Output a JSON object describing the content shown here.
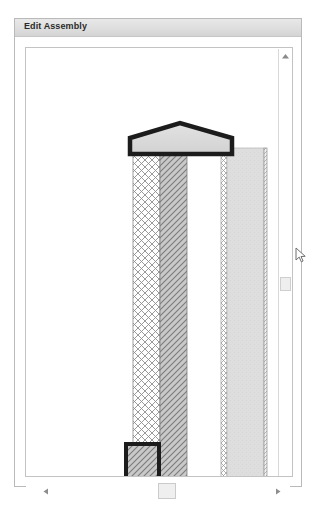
{
  "window": {
    "title": "Edit Assembly"
  },
  "canvas": {
    "name": "assembly-section-preview",
    "background": "#ffffff",
    "border_color": "#c3c3c3"
  },
  "scrollbars": {
    "vertical": {
      "up_arrow_icon": "triangle-up-icon",
      "thumb_icon": "vertical-scroll-thumb",
      "thumb_position_pct": 53
    },
    "horizontal": {
      "left_arrow_icon": "triangle-left-icon",
      "right_arrow_icon": "triangle-right-icon",
      "thumb_icon": "horizontal-scroll-thumb",
      "thumb_position_pct": 50
    }
  },
  "cursor": {
    "icon": "mouse-pointer-icon"
  },
  "assembly": {
    "cap": {
      "name": "top-cap-element",
      "shape": "pentagon-peaked",
      "fill": "#dcdcdc",
      "stroke": "#1c1c1c",
      "stroke_width": 4,
      "x": 113,
      "y": 103,
      "width": 106,
      "height": 31
    },
    "layers": [
      {
        "name": "layer-crosshatch-outer",
        "pattern": "crosshatch",
        "fill": "#ffffff",
        "stroke": "#8c8c8c",
        "x": 117,
        "y": 133,
        "width": 27,
        "height": 330
      },
      {
        "name": "layer-diagonal-hatch-core",
        "pattern": "diagonal-hatch",
        "fill": "#c9c9c9",
        "stroke": "#7d7d7d",
        "x": 144,
        "y": 133,
        "width": 27,
        "height": 330
      },
      {
        "name": "layer-air-gap",
        "pattern": "none",
        "fill": "#ffffff",
        "stroke": "#ffffff",
        "x": 171,
        "y": 133,
        "width": 34,
        "height": 330
      },
      {
        "name": "layer-crosshatch-inner",
        "pattern": "crosshatch",
        "fill": "#ffffff",
        "stroke": "#9a9a9a",
        "x": 205,
        "y": 128,
        "width": 6,
        "height": 335
      },
      {
        "name": "layer-solid-board",
        "pattern": "solid",
        "fill": "#dedede",
        "stroke": "#b4b4b4",
        "x": 211,
        "y": 128,
        "width": 37,
        "height": 335
      },
      {
        "name": "layer-edge-line",
        "pattern": "line",
        "fill": "#f2f2f2",
        "stroke": "#8e8e8e",
        "x": 248,
        "y": 128,
        "width": 3,
        "height": 335
      }
    ],
    "base": {
      "name": "bottom-base-element",
      "shape": "open-bottom-box",
      "pattern": "diagonal-hatch",
      "fill": "#c9c9c9",
      "stroke": "#1c1c1c",
      "stroke_width": 4,
      "x": 108,
      "y": 422,
      "width": 37,
      "height": 42
    }
  }
}
